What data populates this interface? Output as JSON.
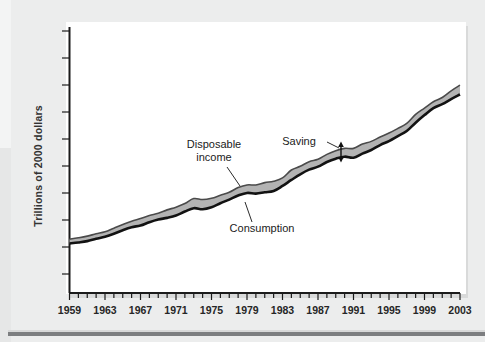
{
  "figure": {
    "y_axis_label": "Trillions of 2000 dollars"
  },
  "annotations": {
    "disposable_income_line1": "Disposable",
    "disposable_income_line2": "income",
    "consumption": "Consumption",
    "saving": "Saving"
  },
  "colors": {
    "page_background": "#eceded",
    "panel_background": "#ffffff",
    "band_fill": "#b3b3b3",
    "consumption_line": "#121212",
    "income_line": "#4a4a4a",
    "axis": "#1b1b1b",
    "text": "#262626"
  },
  "chart_data": {
    "type": "area",
    "title": "",
    "xlabel": "",
    "ylabel": "Trillions of 2000 dollars",
    "xlim": [
      1959,
      2003
    ],
    "ylim": [
      0,
      8
    ],
    "grid": false,
    "legend": "none",
    "xticks_major": [
      1959,
      1963,
      1967,
      1971,
      1975,
      1979,
      1983,
      1987,
      1991,
      1995,
      1999,
      2003
    ],
    "xticks_minor_step": 1,
    "yticks_labeled": false,
    "ytick_count": 8,
    "x": [
      1959,
      1960,
      1961,
      1962,
      1963,
      1964,
      1965,
      1966,
      1967,
      1968,
      1969,
      1970,
      1971,
      1972,
      1973,
      1974,
      1975,
      1976,
      1977,
      1978,
      1979,
      1980,
      1981,
      1982,
      1983,
      1984,
      1985,
      1986,
      1987,
      1988,
      1989,
      1990,
      1991,
      1992,
      1993,
      1994,
      1995,
      1996,
      1997,
      1998,
      1999,
      2000,
      2001,
      2002,
      2003
    ],
    "series": [
      {
        "name": "Disposable income",
        "values": [
          1.62,
          1.66,
          1.71,
          1.78,
          1.84,
          1.95,
          2.06,
          2.16,
          2.24,
          2.33,
          2.4,
          2.5,
          2.58,
          2.69,
          2.84,
          2.81,
          2.85,
          2.94,
          3.03,
          3.17,
          3.25,
          3.25,
          3.32,
          3.36,
          3.46,
          3.7,
          3.81,
          3.95,
          4.02,
          4.17,
          4.28,
          4.35,
          4.35,
          4.48,
          4.56,
          4.69,
          4.81,
          4.95,
          5.1,
          5.37,
          5.56,
          5.75,
          5.88,
          6.08,
          6.25
        ]
      },
      {
        "name": "Consumption",
        "values": [
          1.49,
          1.52,
          1.56,
          1.63,
          1.69,
          1.78,
          1.89,
          1.98,
          2.03,
          2.13,
          2.21,
          2.26,
          2.33,
          2.45,
          2.55,
          2.52,
          2.58,
          2.7,
          2.81,
          2.93,
          3.01,
          2.99,
          3.03,
          3.07,
          3.22,
          3.4,
          3.57,
          3.71,
          3.8,
          3.94,
          4.04,
          4.1,
          4.07,
          4.19,
          4.3,
          4.45,
          4.57,
          4.72,
          4.87,
          5.12,
          5.35,
          5.56,
          5.68,
          5.83,
          5.97
        ]
      }
    ],
    "notes": [
      "Shaded band between the two curves represents Saving",
      "Saving is marked with a double-headed vertical arrow near 1990"
    ]
  }
}
